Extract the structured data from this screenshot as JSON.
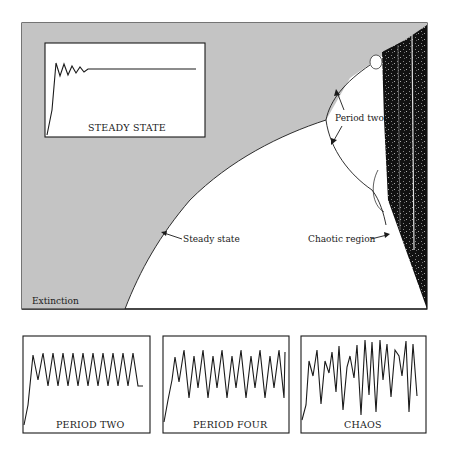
{
  "colors": {
    "background": "#ffffff",
    "extinction_fill": "#c4c4c4",
    "chaos_fill": "#111111",
    "line": "#1a1a1a"
  },
  "main_diagram": {
    "regions": {
      "extinction": "Extinction",
      "steady_state": "Steady state",
      "period_two": "Period two",
      "chaotic_region": "Chaotic region"
    },
    "inset": {
      "caption": "STEADY STATE",
      "points": [
        [
          47,
          135
        ],
        [
          56,
          63
        ],
        [
          60,
          76
        ],
        [
          64,
          64
        ],
        [
          68,
          75
        ],
        [
          72,
          66
        ],
        [
          76,
          73
        ],
        [
          80,
          67
        ],
        [
          84,
          72
        ],
        [
          88,
          69
        ],
        [
          196,
          69
        ]
      ]
    }
  },
  "panels": [
    {
      "id": "period-two",
      "caption": "PERIOD TWO"
    },
    {
      "id": "period-four",
      "caption": "PERIOD FOUR"
    },
    {
      "id": "chaos",
      "caption": "CHAOS"
    }
  ]
}
